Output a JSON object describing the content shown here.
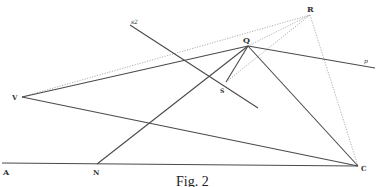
{
  "figure": {
    "caption": "Fig. 2",
    "width": 377,
    "height": 187,
    "colors": {
      "solid_line": "#4a4a4a",
      "dotted_line": "#9a9a9a",
      "label": "#333333"
    }
  },
  "points": {
    "A": {
      "label": "A",
      "x": 2,
      "y": 163
    },
    "N": {
      "label": "N",
      "x": 97,
      "y": 164
    },
    "C": {
      "label": "C",
      "x": 358,
      "y": 166
    },
    "V": {
      "label": "V",
      "x": 22,
      "y": 97
    },
    "Q": {
      "label": "Q",
      "x": 248,
      "y": 46
    },
    "R": {
      "label": "R",
      "x": 310,
      "y": 15
    },
    "S": {
      "label": "S",
      "x": 226,
      "y": 82
    },
    "s2": {
      "label": "s2",
      "x": 130,
      "y": 25
    },
    "p": {
      "label": "p",
      "x": 375,
      "y": 68
    }
  },
  "labels": {
    "A": "A",
    "N": "N",
    "C": "C",
    "V": "V",
    "Q": "Q",
    "R": "R",
    "S": "S",
    "s2": "s2",
    "p": "p"
  },
  "segments_solid": [
    [
      "A",
      "C"
    ],
    [
      "V",
      "Q"
    ],
    [
      "V",
      "C"
    ],
    [
      "N",
      "Q"
    ],
    [
      "Q",
      "C"
    ],
    [
      "Q",
      "p"
    ],
    [
      "S",
      "Q"
    ],
    [
      "s2",
      "S-ext"
    ]
  ],
  "segments_dotted": [
    [
      "V",
      "R"
    ],
    [
      "Q",
      "R"
    ],
    [
      "S",
      "R"
    ],
    [
      "R",
      "C"
    ]
  ]
}
